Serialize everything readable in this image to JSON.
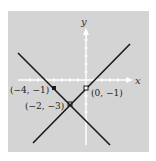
{
  "diagram": {
    "background": "#d4d4d4",
    "axis_color": "#ffffff",
    "line_color": "#1a1a1a",
    "axes": {
      "x_label": "x",
      "y_label": "y"
    },
    "lines": [
      {
        "equation": "y = -x - 5",
        "through": [
          [
            -4,
            -1
          ],
          [
            -2,
            -3
          ]
        ]
      },
      {
        "equation": "y = x - 1",
        "through": [
          [
            0,
            -1
          ],
          [
            -2,
            -3
          ]
        ]
      }
    ],
    "points": [
      {
        "label": "(−4, −1)",
        "x": -4,
        "y": -1
      },
      {
        "label": "(−2, −3)",
        "x": -2,
        "y": -3
      },
      {
        "label": "(0, −1)",
        "x": 0,
        "y": -1
      }
    ]
  }
}
